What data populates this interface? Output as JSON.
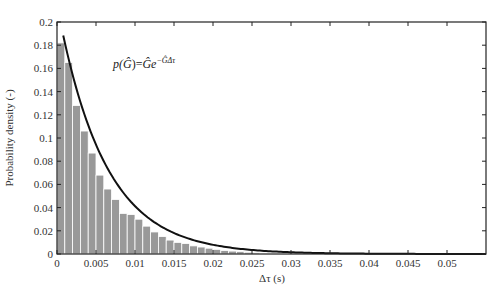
{
  "chart_data": {
    "type": "bar",
    "title": "",
    "xlabel": "Δτ (s)",
    "ylabel": "Probability density (-)",
    "xlim": [
      0,
      0.055
    ],
    "ylim": [
      0,
      0.2
    ],
    "grid": false,
    "x_ticks": [
      "0",
      "0.005",
      "0.01",
      "0.015",
      "0.02",
      "0.025",
      "0.03",
      "0.035",
      "0.04",
      "0.045",
      "0.05"
    ],
    "y_ticks": [
      "0",
      "0.02",
      "0.04",
      "0.06",
      "0.08",
      "0.1",
      "0.12",
      "0.14",
      "0.16",
      "0.18",
      "0.2"
    ],
    "bin_width": 0.001,
    "histogram": {
      "name": "Empirical distribution",
      "bin_starts": [
        0,
        0.001,
        0.002,
        0.003,
        0.004,
        0.005,
        0.006,
        0.007,
        0.008,
        0.009,
        0.01,
        0.011,
        0.012,
        0.013,
        0.014,
        0.015,
        0.016,
        0.017,
        0.018,
        0.019,
        0.02,
        0.021,
        0.022,
        0.023,
        0.024,
        0.025
      ],
      "values": [
        0.182,
        0.165,
        0.128,
        0.106,
        0.087,
        0.068,
        0.056,
        0.047,
        0.035,
        0.034,
        0.03,
        0.024,
        0.019,
        0.015,
        0.012,
        0.01,
        0.009,
        0.007,
        0.006,
        0.005,
        0.004,
        0.003,
        0.0025,
        0.002,
        0.0015,
        0.001
      ],
      "color": "#999999"
    },
    "fit": {
      "name": "Exponential fit",
      "formula": "p(Ĝ)=Ĝe^{-ĜΔτ}",
      "amplitude": 0.215,
      "rate": 165,
      "x_start": 0.0008,
      "x_end": 0.055,
      "color": "#111111"
    },
    "annotations": [
      {
        "text_p": "p(",
        "text_G": "Ĝ",
        "text_eq": ")=",
        "text_G2": "Ĝe",
        "text_sup": "−ĜΔτ",
        "x": 0.0075,
        "y": 0.163
      }
    ]
  }
}
